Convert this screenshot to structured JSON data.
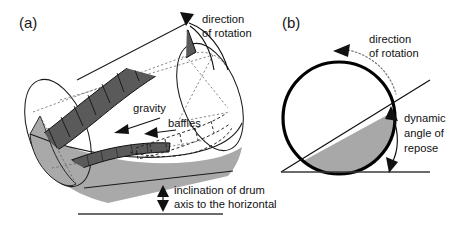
{
  "figure": {
    "type": "scientific-diagram",
    "width": 458,
    "height": 227,
    "background": "#ffffff"
  },
  "colors": {
    "baffle_dark_gray": "#5a5a5a",
    "material_light_gray": "#a9a9a9",
    "drum_body_white": "#ffffff",
    "outline_black": "#111111",
    "hidden_line_gray": "#5f5f5f",
    "panel_b_fill": "#a8a8a8"
  },
  "panel_a": {
    "label": "(a)",
    "view": "three-dimensional perspective of inclined rotating drum",
    "annotations": [
      {
        "name": "direction-of-rotation",
        "line1": "direction",
        "line2": "of rotation",
        "arrow": "curved arc with solid triangular arrowhead at top of drum"
      },
      {
        "name": "gravity",
        "line1": "gravity",
        "arrow": "straight arrow pointing down-left"
      },
      {
        "name": "baffles",
        "line1": "baffles",
        "arrow": "straight arrow pointing left into drum interior"
      },
      {
        "name": "inclination-of-drum-axis",
        "line1": "inclination of drum",
        "line2": "axis to the horizontal",
        "arrow": "vertical double-headed arrow between drum base and horizontal reference line"
      }
    ]
  },
  "panel_b": {
    "label": "(b)",
    "view": "cross-sectional end view of drum",
    "annotations": [
      {
        "name": "direction-of-rotation",
        "line1": "direction",
        "line2": "of rotation",
        "arrow": "dotted curved arc with solid arrowhead, counter-clockwise"
      },
      {
        "name": "dynamic-angle-of-repose",
        "line1": "dynamic",
        "line2": "angle of",
        "line3": "repose",
        "arrow": "double-headed curved arrow between material surface line and horizontal"
      }
    ]
  }
}
